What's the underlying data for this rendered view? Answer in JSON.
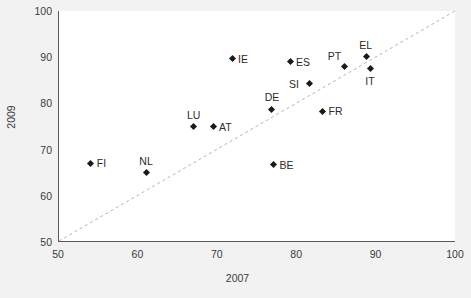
{
  "chart_data": {
    "type": "scatter",
    "title": "",
    "xlabel": "2007",
    "ylabel": "2009",
    "xlim": [
      50,
      100
    ],
    "ylim": [
      50,
      100
    ],
    "xticks": [
      50,
      60,
      70,
      80,
      90,
      100
    ],
    "yticks": [
      50,
      60,
      70,
      80,
      90,
      100
    ],
    "grid": false,
    "legend": null,
    "reference_line": {
      "type": "diagonal",
      "description": "y = x dashed diagonal",
      "from": [
        50,
        50
      ],
      "to": [
        100,
        100
      ],
      "style": "dashed",
      "color": "#b4b4b4"
    },
    "marker": {
      "shape": "diamond",
      "color": "#1a1a1a",
      "size": 5
    },
    "points": [
      {
        "label": "FI",
        "x": 54.0,
        "y": 67.0,
        "label_pos": "right"
      },
      {
        "label": "NL",
        "x": 61.0,
        "y": 65.0,
        "label_pos": "above"
      },
      {
        "label": "LU",
        "x": 67.0,
        "y": 75.0,
        "label_pos": "above"
      },
      {
        "label": "AT",
        "x": 69.4,
        "y": 75.0,
        "label_pos": "right"
      },
      {
        "label": "IE",
        "x": 71.8,
        "y": 89.7,
        "label_pos": "right"
      },
      {
        "label": "DE",
        "x": 76.8,
        "y": 78.7,
        "label_pos": "above"
      },
      {
        "label": "BE",
        "x": 77.0,
        "y": 66.7,
        "label_pos": "right"
      },
      {
        "label": "ES",
        "x": 79.1,
        "y": 89.0,
        "label_pos": "right"
      },
      {
        "label": "SI",
        "x": 81.5,
        "y": 84.2,
        "label_pos": "left"
      },
      {
        "label": "FR",
        "x": 83.2,
        "y": 78.3,
        "label_pos": "right"
      },
      {
        "label": "PT",
        "x": 86.0,
        "y": 87.9,
        "label_pos": "above-left"
      },
      {
        "label": "EL",
        "x": 88.7,
        "y": 90.1,
        "label_pos": "above"
      },
      {
        "label": "IT",
        "x": 89.2,
        "y": 87.5,
        "label_pos": "below"
      }
    ]
  },
  "colors": {
    "page_background": "#f2f2f2",
    "plot_background": "#ffffff",
    "axis": "#595959",
    "text": "#3a3a3a",
    "marker": "#1a1a1a",
    "reference_line": "#b4b4b4"
  }
}
